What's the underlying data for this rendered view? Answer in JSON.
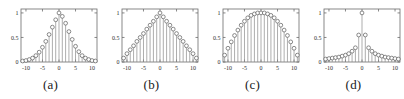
{
  "figure": {
    "panel_count": 4,
    "colors": {
      "axis": "#6b6b6b",
      "stem_line": "#8a8a8a",
      "marker_stroke": "#5a5a5a",
      "marker_fill": "#ffffff",
      "tick_label": "#2b2b2b",
      "caption": "#1a1a1a",
      "background": "#ffffff"
    }
  },
  "chart_data": [
    {
      "type": "line",
      "subtype": "stem",
      "panel_id": "a",
      "caption": "(a)",
      "title": "",
      "xlabel": "",
      "ylabel": "",
      "xlim": [
        -11.5,
        11.5
      ],
      "ylim": [
        0,
        1.08
      ],
      "grid": false,
      "legend": null,
      "xticks": [
        -10,
        -5,
        0,
        5,
        10
      ],
      "xticklabels": [
        "-10",
        "-5",
        "0",
        "5",
        "10"
      ],
      "yticks": [
        0,
        0.5,
        1
      ],
      "yticklabels": [
        "0",
        "0.5",
        "1"
      ],
      "x": [
        -11,
        -10,
        -9,
        -8,
        -7,
        -6,
        -5,
        -4,
        -3,
        -2,
        -1,
        0,
        1,
        2,
        3,
        4,
        5,
        6,
        7,
        8,
        9,
        10,
        11
      ],
      "values": [
        0.02,
        0.03,
        0.05,
        0.08,
        0.13,
        0.2,
        0.3,
        0.42,
        0.56,
        0.71,
        0.86,
        1.0,
        0.93,
        0.79,
        0.62,
        0.46,
        0.32,
        0.21,
        0.13,
        0.08,
        0.05,
        0.03,
        0.02
      ]
    },
    {
      "type": "line",
      "subtype": "stem",
      "panel_id": "b",
      "caption": "(b)",
      "title": "",
      "xlabel": "",
      "ylabel": "",
      "xlim": [
        -11.5,
        11.5
      ],
      "ylim": [
        0,
        1.08
      ],
      "grid": false,
      "legend": null,
      "xticks": [
        -10,
        -5,
        0,
        5,
        10
      ],
      "xticklabels": [
        "-10",
        "-5",
        "0",
        "5",
        "10"
      ],
      "yticks": [
        0,
        0.5,
        1
      ],
      "yticklabels": [
        "0",
        "0.5",
        "1"
      ],
      "x": [
        -11,
        -10,
        -9,
        -8,
        -7,
        -6,
        -5,
        -4,
        -3,
        -2,
        -1,
        0,
        1,
        2,
        3,
        4,
        5,
        6,
        7,
        8,
        9,
        10,
        11
      ],
      "values": [
        0.08,
        0.17,
        0.25,
        0.33,
        0.42,
        0.5,
        0.58,
        0.67,
        0.75,
        0.83,
        0.92,
        1.0,
        0.92,
        0.83,
        0.75,
        0.67,
        0.58,
        0.5,
        0.42,
        0.33,
        0.25,
        0.17,
        0.08
      ]
    },
    {
      "type": "line",
      "subtype": "stem",
      "panel_id": "c",
      "caption": "(c)",
      "title": "",
      "xlabel": "",
      "ylabel": "",
      "xlim": [
        -11.5,
        11.5
      ],
      "ylim": [
        0,
        1.08
      ],
      "grid": false,
      "legend": null,
      "xticks": [
        -10,
        -5,
        0,
        5,
        10
      ],
      "xticklabels": [
        "-10",
        "-5",
        "0",
        "5",
        "10"
      ],
      "yticks": [
        0,
        0.5,
        1
      ],
      "yticklabels": [
        "0",
        "0.5",
        "1"
      ],
      "x": [
        -11,
        -10,
        -9,
        -8,
        -7,
        -6,
        -5,
        -4,
        -3,
        -2,
        -1,
        0,
        1,
        2,
        3,
        4,
        5,
        6,
        7,
        8,
        9,
        10,
        11
      ],
      "values": [
        0.14,
        0.28,
        0.41,
        0.54,
        0.65,
        0.75,
        0.83,
        0.9,
        0.95,
        0.98,
        1.0,
        1.0,
        1.0,
        0.98,
        0.95,
        0.9,
        0.83,
        0.75,
        0.65,
        0.54,
        0.41,
        0.28,
        0.14
      ]
    },
    {
      "type": "line",
      "subtype": "stem",
      "panel_id": "d",
      "caption": "(d)",
      "title": "",
      "xlabel": "",
      "ylabel": "",
      "xlim": [
        -11.5,
        11.5
      ],
      "ylim": [
        0,
        1.08
      ],
      "grid": false,
      "legend": null,
      "xticks": [
        -10,
        -5,
        0,
        5,
        10
      ],
      "xticklabels": [
        "-10",
        "-5",
        "0",
        "5",
        "10"
      ],
      "yticks": [
        0,
        0.5,
        1
      ],
      "yticklabels": [
        "0",
        "0.5",
        "1"
      ],
      "x": [
        -11,
        -10,
        -9,
        -8,
        -7,
        -6,
        -5,
        -4,
        -3,
        -2,
        -1,
        0,
        1,
        2,
        3,
        4,
        5,
        6,
        7,
        8,
        9,
        10,
        11
      ],
      "values": [
        0.06,
        0.07,
        0.08,
        0.09,
        0.1,
        0.12,
        0.14,
        0.17,
        0.22,
        0.29,
        0.55,
        1.0,
        0.55,
        0.29,
        0.22,
        0.17,
        0.14,
        0.12,
        0.1,
        0.09,
        0.08,
        0.07,
        0.06
      ]
    }
  ]
}
